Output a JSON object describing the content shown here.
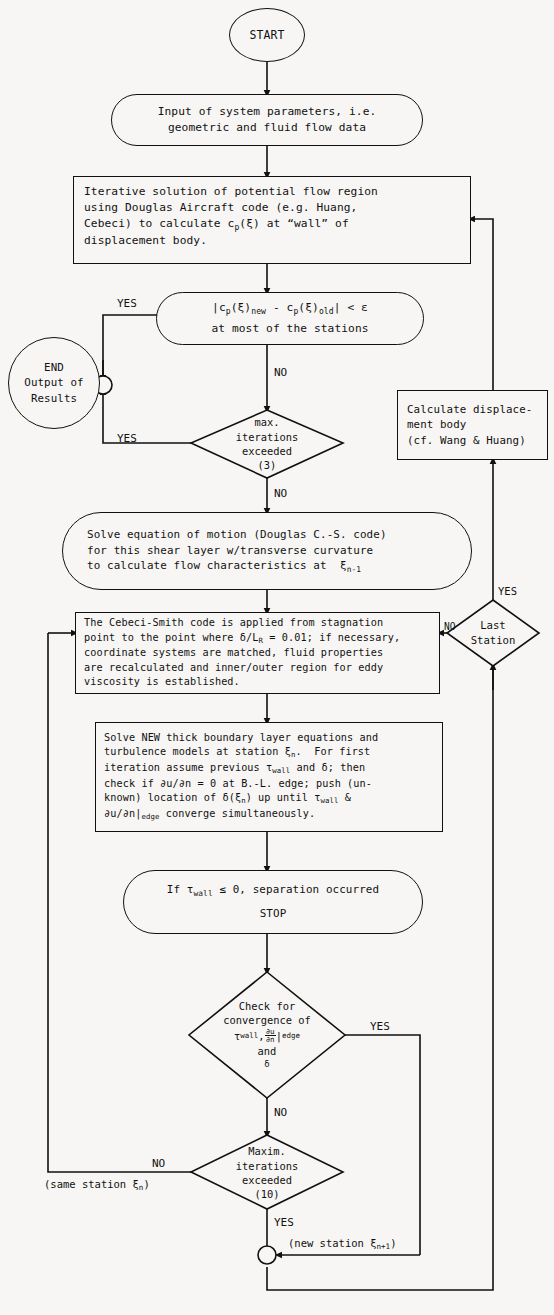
{
  "diagram": {
    "type": "flowchart",
    "background": "#f7f6f4",
    "ink": "#111111"
  },
  "nodes": {
    "start": {
      "label": "START",
      "shape": "circle"
    },
    "input": {
      "line1": "Input of system parameters, i.e.",
      "line2": "geometric and fluid flow data",
      "shape": "stadium"
    },
    "potential_flow": {
      "line1": "Iterative solution of potential flow region",
      "line2": "using Douglas Aircraft code (e.g. Huang,",
      "line3_a": "Cebeci) to calculate c",
      "line3_sub": "p",
      "line3_b": "(ξ) at “wall” of",
      "line4": "displacement body.",
      "shape": "rect"
    },
    "cp_test": {
      "line1_a": "|c",
      "line1_sub1": "p",
      "line1_b": "(ξ)",
      "line1_sub2": "new",
      "line1_c": " - c",
      "line1_sub3": "p",
      "line1_d": "(ξ)",
      "line1_sub4": "old",
      "line1_e": "| < ε",
      "line2": "at most of the stations",
      "shape": "stadium"
    },
    "end": {
      "line1": "END",
      "line2": "Output of",
      "line3": "Results",
      "shape": "circle"
    },
    "max_iter_3": {
      "line1": "max.",
      "line2": "iterations",
      "line3": "exceeded",
      "line4": "(3)",
      "shape": "diamond"
    },
    "calc_displacement": {
      "line1": "Calculate displace-",
      "line2": "ment body",
      "line3": "(cf. Wang & Huang)",
      "shape": "rect"
    },
    "solve_eom": {
      "line1": "Solve equation of motion (Douglas C.-S. code)",
      "line2": "for this shear layer w/transverse curvature",
      "line3_a": "to calculate flow characteristics at  ξ",
      "line3_sub": "n-1",
      "shape": "stadium"
    },
    "cebeci_smith": {
      "line1": "The Cebeci-Smith code is applied from stagnation",
      "line2_a": "point to the point where δ/L",
      "line2_sub": "R",
      "line2_b": " = 0.01; if necessary,",
      "line3": "coordinate systems are matched, fluid properties",
      "line4": "are recalculated and inner/outer region for eddy",
      "line5": "viscosity is established.",
      "shape": "rect"
    },
    "last_station": {
      "line1": "Last",
      "line2": "Station",
      "shape": "diamond"
    },
    "solve_new_bl": {
      "line1": "Solve NEW thick boundary layer equations and",
      "line2_a": "turbulence models at station ξ",
      "line2_sub": "n",
      "line2_b": ".  For first",
      "line3_a": "iteration assume previous τ",
      "line3_sub": "wall",
      "line3_b": " and δ; then",
      "line4": "check if ∂u/∂n = 0 at B.-L. edge; push (un-",
      "line5_a": "known) location of δ(ξ",
      "line5_sub": "n",
      "line5_b": ") up until τ",
      "line5_sub2": "wall",
      "line5_c": " &",
      "line6_a": "∂u/∂n|",
      "line6_sub": "edge",
      "line6_b": " converge simultaneously.",
      "shape": "rect"
    },
    "separation": {
      "line1_a": "If τ",
      "line1_sub": "wall",
      "line1_b": " ≤ 0, separation occurred",
      "line2": "STOP",
      "shape": "stadium"
    },
    "convergence_check": {
      "line1": "Check for",
      "line2": "convergence of",
      "line3_a": "τ",
      "line3_sub": "wall",
      "line3_b": ",",
      "line3_frac_num": "∂u",
      "line3_frac_den": "∂n",
      "line3_sub2": "edge",
      "line4": "and",
      "line5": "δ",
      "shape": "diamond"
    },
    "max_iter_10": {
      "line1": "Maxim.",
      "line2": "iterations",
      "line3": "exceeded",
      "line4": "(10)",
      "shape": "diamond"
    }
  },
  "edge_labels": {
    "yes_cp": "YES",
    "no_cp": "NO",
    "yes_maxiter3": "YES",
    "no_maxiter3": "NO",
    "no_laststation": "NO",
    "yes_laststation": "YES",
    "yes_convergence": "YES",
    "no_convergence": "NO",
    "no_maxiter10": "NO",
    "same_station_a": "(same station ξ",
    "same_station_sub": "n",
    "same_station_b": ")",
    "yes_maxiter10": "YES",
    "new_station_a": "(new station ξ",
    "new_station_sub": "n+1",
    "new_station_b": ")"
  }
}
